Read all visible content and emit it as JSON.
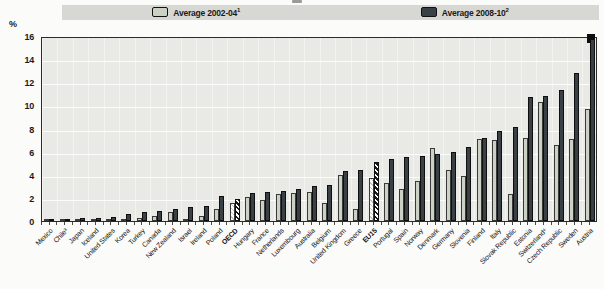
{
  "unit_label": "%",
  "legend": [
    {
      "label": "Average 2002-04",
      "sup": "1",
      "swatch": "light"
    },
    {
      "label": "Average 2008-10",
      "sup": "2",
      "swatch": "dark"
    }
  ],
  "colors": {
    "series_2002_04": "#ccd1c6",
    "series_2008_10": "#3a4146",
    "plot_background": "#e9e9e6",
    "legend_strip": "#d7d7d4"
  },
  "chart_data": {
    "type": "bar",
    "title": "",
    "xlabel": "",
    "ylabel": "%",
    "ylim": [
      0,
      16
    ],
    "ytick_step": 2,
    "grid": true,
    "legend_position": "top",
    "categories": [
      "Mexico",
      "Chile³",
      "Japan",
      "Iceland",
      "United States",
      "Korea",
      "Turkey",
      "Canada",
      "New Zealand",
      "Israel",
      "Ireland",
      "Poland",
      "OECD",
      "Hungary",
      "France",
      "Netherlands",
      "Luxembourg",
      "Australia",
      "Belgium",
      "United Kingdom",
      "Greece",
      "EU15",
      "Portugal",
      "Spain",
      "Norway",
      "Denmark",
      "Germany",
      "Slovenia",
      "Finland",
      "Italy",
      "Slovak Republic",
      "Estonia",
      "Switzerland⁴",
      "Czech Republic",
      "Sweden",
      "Austria"
    ],
    "series": [
      {
        "name": "Average 2002-04¹",
        "values": [
          0.05,
          0.1,
          0.15,
          0.2,
          0.2,
          0.2,
          0.25,
          0.4,
          0.8,
          0.2,
          0.4,
          1.0,
          1.6,
          2.1,
          1.8,
          2.3,
          2.4,
          2.5,
          1.6,
          4.0,
          1.0,
          3.7,
          3.3,
          2.8,
          3.5,
          6.3,
          4.4,
          3.9,
          7.1,
          7.0,
          2.3,
          7.2,
          10.3,
          6.6,
          7.1,
          9.7
        ]
      },
      {
        "name": "Average 2008-10²",
        "values": [
          0.1,
          0.15,
          0.25,
          0.3,
          0.35,
          0.6,
          0.8,
          0.9,
          1.0,
          1.2,
          1.3,
          2.2,
          1.9,
          2.4,
          2.5,
          2.6,
          2.8,
          3.0,
          3.1,
          4.3,
          4.4,
          5.1,
          5.4,
          5.5,
          5.6,
          5.8,
          6.0,
          6.4,
          7.2,
          7.8,
          8.1,
          10.7,
          10.8,
          11.3,
          12.8,
          15.7
        ]
      }
    ],
    "hatched_categories": [
      "OECD",
      "EU15"
    ],
    "bold_categories": [
      "OECD",
      "EU15"
    ]
  }
}
